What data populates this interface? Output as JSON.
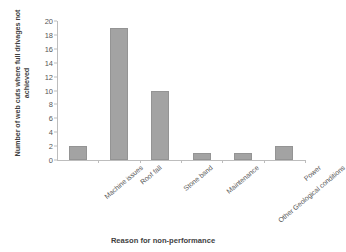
{
  "chart_data": {
    "type": "bar",
    "title": "",
    "xlabel": "Reason for non-performance",
    "ylabel": "Number of web cuts where full drivages not achieved",
    "categories": [
      "Machine issues",
      "Roof fall",
      "Stone band",
      "Maintenance",
      "Other Geological conditions",
      "Power"
    ],
    "values": [
      2,
      19,
      10,
      1,
      1,
      2
    ],
    "ylim": [
      0,
      20
    ],
    "yticks": [
      0,
      2,
      4,
      6,
      8,
      10,
      12,
      14,
      16,
      18,
      20
    ],
    "ytick_labels": [
      "0",
      "2",
      "4",
      "6",
      "8",
      "10",
      "12",
      "14",
      "16",
      "18",
      "20"
    ],
    "grid": false,
    "legend": false,
    "bar_color": "#a3a3a3",
    "axis_color": "#bdbdbd"
  }
}
